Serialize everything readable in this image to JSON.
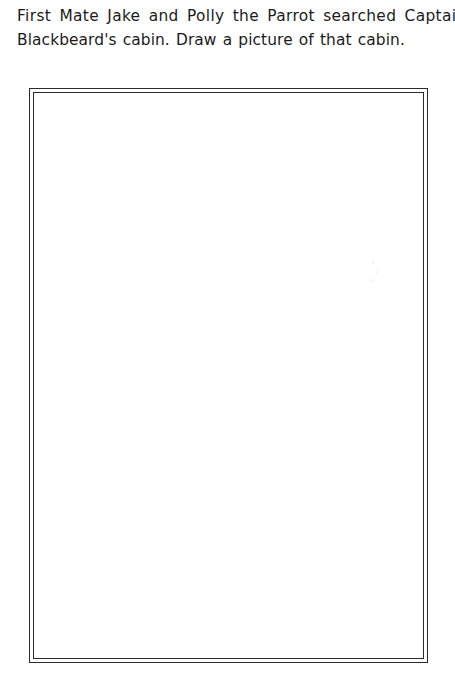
{
  "worksheet": {
    "prompt": {
      "line1": "First Mate Jake and Polly the Parrot searched Captain",
      "line2": "Blackbeard's cabin. Draw a picture of that cabin.",
      "full_text": "First Mate Jake and Polly the Parrot searched Captain Blackbeard's cabin. Draw a picture of that cabin."
    },
    "drawing_box": {
      "label": "",
      "content": "",
      "placeholder": ""
    },
    "colors": {
      "page_background": "#ffffff",
      "text": "#1b1b1b",
      "frame_line": "#2b2b2b",
      "box_fill": "#ffffff"
    }
  }
}
